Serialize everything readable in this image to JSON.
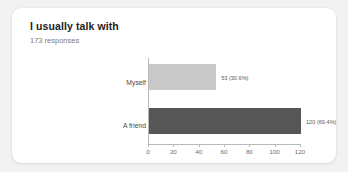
{
  "card": {
    "title": "I usually talk with",
    "subtitle": "173 responses",
    "background_color": "#ffffff",
    "page_background_color": "#f2f2f2"
  },
  "chart_data": {
    "type": "bar",
    "orientation": "horizontal",
    "title": "I usually talk with",
    "subtitle": "173 responses",
    "total_responses": 173,
    "categories": [
      "Myself",
      "A friend"
    ],
    "values": [
      53,
      120
    ],
    "percentages": [
      "30.6%",
      "69.4%"
    ],
    "data_labels": [
      "53 (30.6%)",
      "120 (69.4%)"
    ],
    "bar_colors": [
      "#c9c9c9",
      "#565656"
    ],
    "xlabel": "",
    "ylabel": "",
    "xlim": [
      0,
      120
    ],
    "xticks": [
      0,
      20,
      40,
      60,
      80,
      100,
      120
    ],
    "xtick_labels": [
      "0",
      "20",
      "40",
      "60",
      "80",
      "100",
      "120"
    ],
    "grid": false,
    "legend": false
  }
}
